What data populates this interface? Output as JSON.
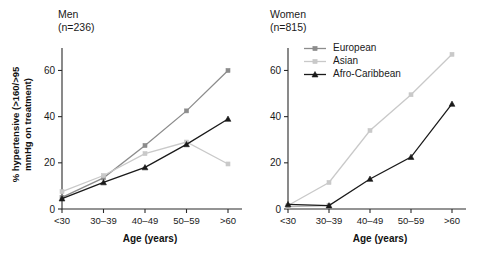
{
  "figure": {
    "background": "#ffffff",
    "width": 503,
    "height": 255
  },
  "axis_label_x": "Age (years)",
  "axis_label_y_line1": "% hypertensive (>160/>95",
  "axis_label_y_line2": "mmHg on treatment)",
  "axis_label_y": "% hypertensive (>160/>95 mmHg on treatment)",
  "panels": {
    "men": {
      "title_line1": "Men",
      "title_line2": "(n=236)",
      "xlabel": "Age (years)",
      "ytick_labels": [
        "0",
        "20",
        "40",
        "60"
      ],
      "xtick_labels": [
        "<30",
        "30–39",
        "40–49",
        "50–59",
        ">60"
      ]
    },
    "women": {
      "title_line1": "Women",
      "title_line2": "(n=815)",
      "xlabel": "Age (years)",
      "ytick_labels": [
        "0",
        "20",
        "40",
        "60"
      ],
      "xtick_labels": [
        "<30",
        "30–39",
        "40–49",
        "50–59",
        ">60"
      ]
    }
  },
  "legend": {
    "position": "upper-left-of-women-panel",
    "entries": [
      {
        "label": "European",
        "color": "#8c8c8c",
        "marker": "square"
      },
      {
        "label": "Asian",
        "color": "#c9c9c9",
        "marker": "square"
      },
      {
        "label": "Afro-Caribbean",
        "color": "#1a1a1a",
        "marker": "triangle"
      }
    ]
  },
  "chart_data": [
    {
      "type": "line",
      "title": "Men (n=236)",
      "xlabel": "Age (years)",
      "ylabel": "% hypertensive (>160/>95 mmHg on treatment)",
      "categories": [
        "<30",
        "30–39",
        "40–49",
        "50–59",
        ">60"
      ],
      "ylim": [
        0,
        68
      ],
      "yticks": [
        0,
        20,
        40,
        60
      ],
      "grid": false,
      "legend_position": "none",
      "series": [
        {
          "name": "European",
          "color": "#8c8c8c",
          "marker": "square",
          "values": [
            5,
            13.5,
            27.5,
            42.5,
            60
          ]
        },
        {
          "name": "Asian",
          "color": "#c9c9c9",
          "marker": "square",
          "values": [
            7.5,
            14.5,
            24,
            29,
            19.5
          ]
        },
        {
          "name": "Afro-Caribbean",
          "color": "#1a1a1a",
          "marker": "triangle",
          "values": [
            4.5,
            11.5,
            18,
            28,
            39
          ]
        }
      ]
    },
    {
      "type": "line",
      "title": "Women (n=815)",
      "xlabel": "Age (years)",
      "ylabel": "% hypertensive (>160/>95 mmHg on treatment)",
      "categories": [
        "<30",
        "30–39",
        "40–49",
        "50–59",
        ">60"
      ],
      "ylim": [
        0,
        68
      ],
      "yticks": [
        0,
        20,
        40,
        60
      ],
      "grid": false,
      "legend_position": "upper-left",
      "series": [
        {
          "name": "European",
          "color": "#c9c9c9",
          "marker": "square",
          "values": [
            1.5,
            11.5,
            34,
            49.5,
            67
          ]
        },
        {
          "name": "Asian",
          "color": "#b0b0b0",
          "marker": "square",
          "values": [
            1,
            1.5,
            null,
            null,
            null
          ]
        },
        {
          "name": "Afro-Caribbean",
          "color": "#1a1a1a",
          "marker": "triangle",
          "values": [
            2,
            1.5,
            13,
            22.5,
            45.5
          ]
        }
      ]
    }
  ]
}
